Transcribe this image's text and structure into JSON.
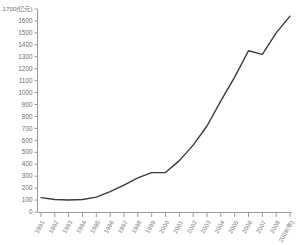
{
  "chart_data": {
    "type": "line",
    "title": "",
    "xlabel": "年",
    "ylabel": "亿元",
    "y_axis_unit_label": "(亿元)",
    "top_tick_label": "1700(亿元)",
    "x_axis_last_label": "2009(年)",
    "grid": false,
    "legend": false,
    "xlim_categories": 19,
    "ylim": [
      0,
      1700
    ],
    "ytick_step": 100,
    "yticks": [
      0,
      100,
      200,
      300,
      400,
      500,
      600,
      700,
      800,
      900,
      1000,
      1100,
      1200,
      1300,
      1400,
      1500,
      1600,
      1700
    ],
    "ytick_labels": [
      "0",
      "100",
      "200",
      "300",
      "400",
      "500",
      "600",
      "700",
      "800",
      "900",
      "1000",
      "1100",
      "1200",
      "1300",
      "1400",
      "1500",
      "1600",
      "1700(亿元)"
    ],
    "categories": [
      "1991",
      "1992",
      "1993",
      "1994",
      "1995",
      "1996",
      "1997",
      "1998",
      "1999",
      "2000",
      "2001",
      "2002",
      "2003",
      "2004",
      "2005",
      "2006",
      "2007",
      "2008",
      "2009(年)"
    ],
    "series": [
      {
        "name": "",
        "color": "#3a3a3a",
        "values": [
          120,
          105,
          100,
          105,
          125,
          170,
          225,
          285,
          330,
          330,
          430,
          560,
          720,
          930,
          1130,
          1350,
          1320,
          1500,
          1640
        ]
      }
    ]
  },
  "axes": {
    "y_axis_name": "y-axis",
    "x_axis_name": "x-axis"
  }
}
